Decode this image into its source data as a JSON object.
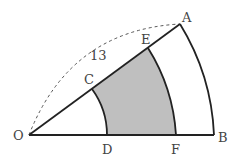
{
  "diagram": {
    "type": "geometry-sector",
    "labels": {
      "O": "O",
      "A": "A",
      "B": "B",
      "C": "C",
      "D": "D",
      "E": "E",
      "F": "F",
      "arc_length": "13"
    },
    "points": {
      "O": [
        29,
        135
      ],
      "A": [
        180,
        24
      ],
      "B": [
        214,
        135
      ],
      "C": [
        92,
        89
      ],
      "D": [
        107,
        135
      ],
      "E": [
        148,
        48
      ],
      "F": [
        176,
        135
      ]
    },
    "colors": {
      "stroke": "#222222",
      "shade": "#bfbfbf",
      "dashed": "#555555",
      "text": "#444444"
    }
  }
}
